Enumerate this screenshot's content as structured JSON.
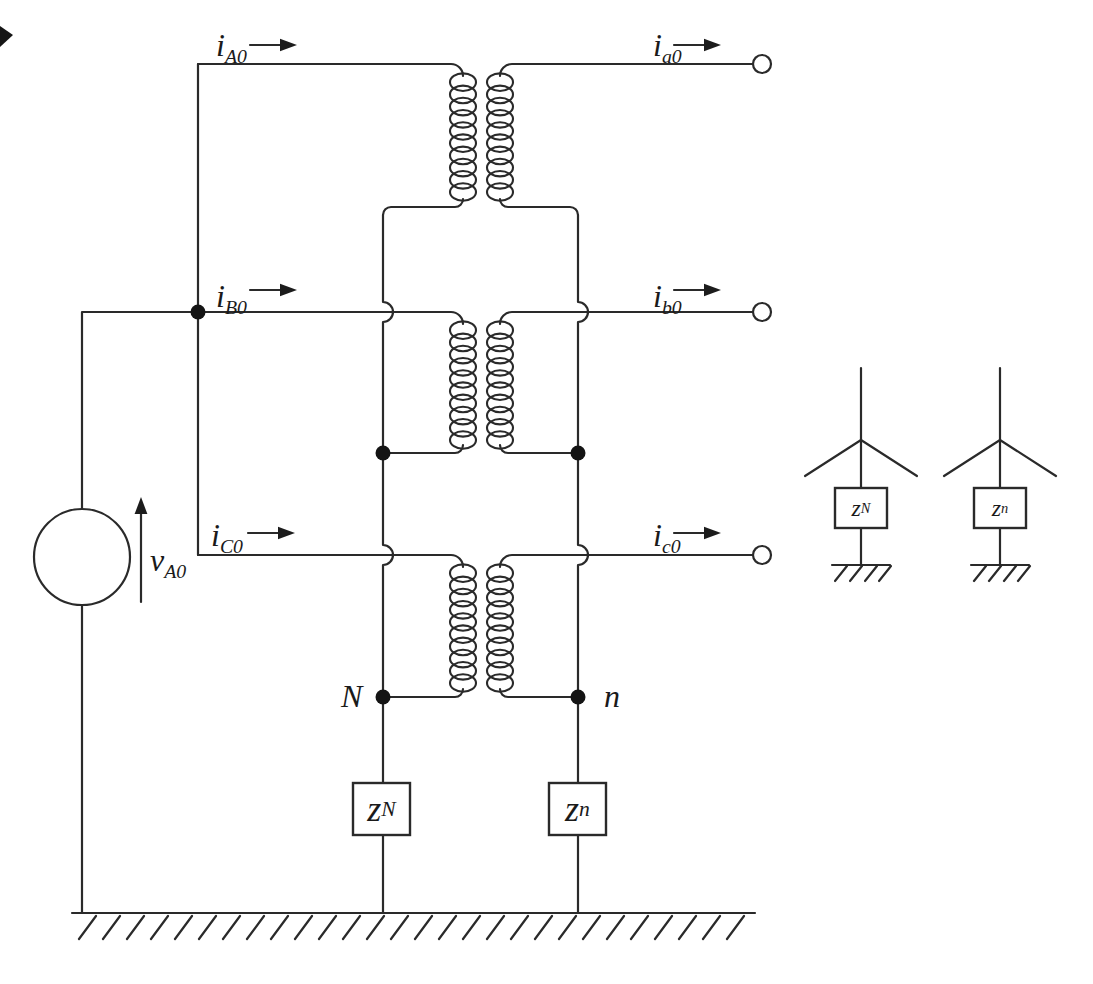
{
  "colors": {
    "line": "#2a2a2a",
    "text": "#1a1a1a",
    "background": "#ffffff"
  },
  "labels": {
    "i_A0": {
      "main": "i",
      "sub": "A0"
    },
    "i_B0": {
      "main": "i",
      "sub": "B0"
    },
    "i_C0": {
      "main": "i",
      "sub": "C0"
    },
    "i_a0": {
      "main": "i",
      "sub": "a0"
    },
    "i_b0": {
      "main": "i",
      "sub": "b0"
    },
    "i_c0": {
      "main": "i",
      "sub": "c0"
    },
    "v_A0": {
      "main": "v",
      "sub": "A0"
    },
    "node_N": "N",
    "node_n": "n",
    "z_N": {
      "main": "z",
      "sub": "N"
    },
    "z_n": {
      "main": "z",
      "sub": "n"
    },
    "wye_z_N": {
      "main": "z",
      "sub": "N"
    },
    "wye_z_n": {
      "main": "z",
      "sub": "n"
    }
  }
}
